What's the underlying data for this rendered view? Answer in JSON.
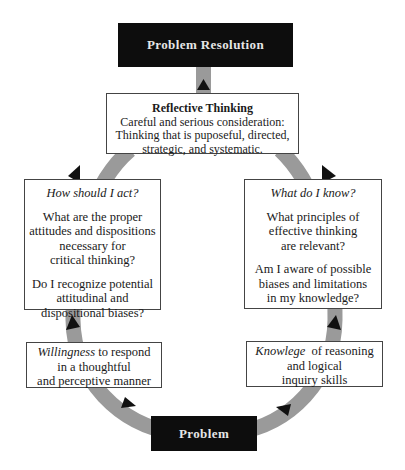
{
  "diagram": {
    "top_node": {
      "label": "Problem Resolution"
    },
    "center_node": {
      "title": "Reflective Thinking",
      "lines": [
        "Careful and serious consideration:",
        "Thinking that is puposeful, directed,",
        "strategic, and systematic."
      ]
    },
    "left_question_node": {
      "heading": "How should I act?",
      "paragraph1": [
        "What are the proper",
        "attitudes and dispositions",
        "necessary for",
        "critical thinking?"
      ],
      "paragraph2": [
        "Do I recognize potential",
        "attitudinal and",
        "dispositional biases?"
      ]
    },
    "right_question_node": {
      "heading": "What do I know?",
      "paragraph1": [
        "What principles of",
        "effective thinking",
        "are relevant?"
      ],
      "paragraph2": [
        "Am I aware of possible",
        "biases and limitations",
        "in my knowledge?"
      ]
    },
    "left_base_node": {
      "emphasis": "Willingness",
      "rest_line1": " to respond",
      "lines": [
        "in a thoughtful",
        "and perceptive manner"
      ]
    },
    "right_base_node": {
      "emphasis": "Knowlege",
      "rest_line1": "  of reasoning",
      "lines": [
        "and logical",
        "inquiry skills"
      ]
    },
    "bottom_node": {
      "label": "Problem"
    },
    "colors": {
      "dark_box": "#0d0d0d",
      "ring": "#9a9a9a",
      "arrow": "#111111",
      "border": "#444444"
    }
  }
}
